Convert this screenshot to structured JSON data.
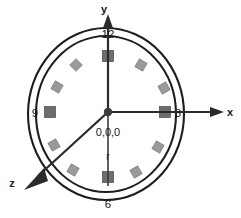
{
  "figure": {
    "background_color": "#ffffff"
  },
  "axes": {
    "x": {
      "label": "x",
      "label_x": 228,
      "label_y": 116,
      "line": {
        "x1": 108,
        "y1": 112,
        "x2": 212,
        "y2": 112
      },
      "arrow": "M212,107 L224,112 L212,117 Z",
      "direction": "right"
    },
    "y": {
      "label": "y",
      "label_x": 104,
      "label_y": 13,
      "line": {
        "x1": 108,
        "y1": 112,
        "x2": 108,
        "y2": 26
      },
      "arrow": "M103,26 L108,15 L113,26 Z",
      "direction": "up"
    },
    "z": {
      "label": "z",
      "label_x": 12,
      "label_y": 186,
      "line": {
        "x1": 108,
        "y1": 112,
        "x2": 34,
        "y2": 180
      },
      "arrow": "M41,172 L24,190 L46,182 Z",
      "direction": "down-left"
    }
  },
  "origin": {
    "label": "0,0,0",
    "label_x": 90,
    "label_y": 135,
    "cx": 108,
    "cy": 112,
    "r": 4.2,
    "color": "#3d3d3d"
  },
  "radius": {
    "label": "r",
    "label_x": 105,
    "label_y": 158,
    "line": {
      "x1": 108,
      "y1": 112,
      "x2": 108,
      "y2": 186
    }
  },
  "circles": {
    "outer": {
      "cx": 106,
      "cy": 114,
      "rx": 78,
      "ry": 86,
      "stroke": "#1e1e1e"
    },
    "inner": {
      "cx": 106,
      "cy": 114,
      "rx": 70,
      "ry": 78,
      "stroke": "#1e1e1e"
    }
  },
  "hour_labels": [
    {
      "name": "hour-label-12",
      "text": "12",
      "x": 108,
      "y": 38,
      "anchor": "middle"
    },
    {
      "name": "hour-label-3",
      "text": "3",
      "x": 178,
      "y": 117,
      "anchor": "middle"
    },
    {
      "name": "hour-label-6",
      "text": "6",
      "x": 108,
      "y": 207,
      "anchor": "middle"
    },
    {
      "name": "hour-label-9",
      "text": "9",
      "x": 35,
      "y": 117,
      "anchor": "middle"
    }
  ],
  "markers": {
    "major_color": "#6d6d6d",
    "minor_color": "#9a9a9a",
    "items": [
      {
        "name": "hour-marker-12",
        "hour": 12,
        "cx": 108,
        "cy": 56,
        "size": 11,
        "rotate": 0,
        "kind": "major"
      },
      {
        "name": "hour-marker-1",
        "hour": 1,
        "cx": 141,
        "cy": 65,
        "size": 9,
        "rotate": 30,
        "kind": "minor"
      },
      {
        "name": "hour-marker-2",
        "hour": 2,
        "cx": 164,
        "cy": 88,
        "size": 9,
        "rotate": 60,
        "kind": "minor"
      },
      {
        "name": "hour-marker-3",
        "hour": 3,
        "cx": 165,
        "cy": 112,
        "size": 11,
        "rotate": 0,
        "kind": "major"
      },
      {
        "name": "hour-marker-4",
        "hour": 4,
        "cx": 158,
        "cy": 147,
        "size": 9,
        "rotate": 30,
        "kind": "minor"
      },
      {
        "name": "hour-marker-5",
        "hour": 5,
        "cx": 136,
        "cy": 172,
        "size": 9,
        "rotate": 60,
        "kind": "minor"
      },
      {
        "name": "hour-marker-6",
        "hour": 6,
        "cx": 108,
        "cy": 177,
        "size": 11,
        "rotate": 0,
        "kind": "major"
      },
      {
        "name": "hour-marker-7",
        "hour": 7,
        "cx": 73,
        "cy": 170,
        "size": 9,
        "rotate": 30,
        "kind": "minor"
      },
      {
        "name": "hour-marker-8",
        "hour": 8,
        "cx": 54,
        "cy": 145,
        "size": 9,
        "rotate": 60,
        "kind": "minor"
      },
      {
        "name": "hour-marker-9",
        "hour": 9,
        "cx": 50,
        "cy": 112,
        "size": 11,
        "rotate": 0,
        "kind": "major"
      },
      {
        "name": "hour-marker-10",
        "hour": 10,
        "cx": 57,
        "cy": 87,
        "size": 9,
        "rotate": 30,
        "kind": "minor"
      },
      {
        "name": "hour-marker-11",
        "hour": 11,
        "cx": 76,
        "cy": 65,
        "size": 9,
        "rotate": 45,
        "kind": "minor"
      }
    ]
  }
}
